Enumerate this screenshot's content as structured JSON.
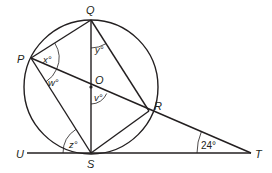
{
  "diagram": {
    "points": {
      "P": {
        "label": "P",
        "x": 31,
        "y": 58
      },
      "Q": {
        "label": "Q",
        "x": 91,
        "y": 20
      },
      "O": {
        "label": "O",
        "x": 91,
        "y": 87
      },
      "R": {
        "label": "R",
        "x": 149,
        "y": 111
      },
      "S": {
        "label": "S",
        "x": 91,
        "y": 153
      },
      "T": {
        "label": "T",
        "x": 251,
        "y": 153
      },
      "U": {
        "label": "U",
        "x": 20,
        "y": 153
      }
    },
    "circle": {
      "center": "O",
      "radius": 67
    },
    "segments": [
      "PQ",
      "QS",
      "QR",
      "PT",
      "PS",
      "SR",
      "UT"
    ],
    "angles": {
      "x": {
        "label": "x°",
        "vertex": "P"
      },
      "w": {
        "label": "w°",
        "vertex": "P"
      },
      "y": {
        "label": "y°",
        "vertex": "Q"
      },
      "v": {
        "label": "v°",
        "vertex": "O"
      },
      "z": {
        "label": "z°",
        "vertex": "S"
      },
      "t": {
        "label": "24°",
        "vertex": "T",
        "value": 24
      }
    },
    "colors": {
      "stroke": "#231f20",
      "background": "#ffffff"
    }
  }
}
